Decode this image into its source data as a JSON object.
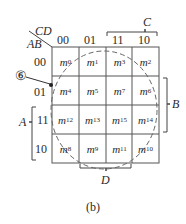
{
  "diagram": {
    "type": "karnaugh-map",
    "variables": {
      "row": "AB",
      "col": "CD"
    },
    "corner_label_col": "CD",
    "corner_label_row": "AB",
    "column_headers": [
      "00",
      "01",
      "11",
      "10"
    ],
    "row_headers": [
      "00",
      "01",
      "11",
      "10"
    ],
    "cells": [
      [
        {
          "m": "m",
          "i": "0"
        },
        {
          "m": "m",
          "i": "1"
        },
        {
          "m": "m",
          "i": "3"
        },
        {
          "m": "m",
          "i": "2"
        }
      ],
      [
        {
          "m": "m",
          "i": "4"
        },
        {
          "m": "m",
          "i": "5"
        },
        {
          "m": "m",
          "i": "7"
        },
        {
          "m": "m",
          "i": "6"
        }
      ],
      [
        {
          "m": "m",
          "i": "12"
        },
        {
          "m": "m",
          "i": "13"
        },
        {
          "m": "m",
          "i": "15"
        },
        {
          "m": "m",
          "i": "14"
        }
      ],
      [
        {
          "m": "m",
          "i": "8"
        },
        {
          "m": "m",
          "i": "9"
        },
        {
          "m": "m",
          "i": "11"
        },
        {
          "m": "m",
          "i": "10"
        }
      ]
    ],
    "brackets": {
      "C": "C",
      "B": "B",
      "A": "A",
      "D": "D"
    },
    "callout": "⑥",
    "caption": "(b)",
    "grid_color": "#555555",
    "dashed_circle_color": "#666666"
  }
}
